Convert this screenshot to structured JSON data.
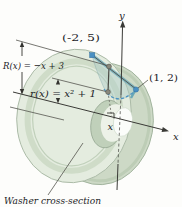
{
  "figure": {
    "type": "textbook-diagram",
    "points": {
      "upper": "(-2, 5)",
      "lower": "(1, 2)"
    },
    "labels": {
      "outer_radius": "R(x) = −x + 3",
      "inner_radius": "r(x) = x² + 1",
      "y_axis": "y",
      "x_axis": "x",
      "sample_x": "x",
      "caption": "Washer cross-section"
    },
    "colors": {
      "washer_face": "#e4ecdf",
      "washer_edge": "#a9b8a4",
      "washer_back": "#cdd9c6",
      "hole_rim": "#c0d0ba",
      "slab_fill": "rgba(174,203,199,0.45)",
      "slab_edge_teal": "#74aebb",
      "accent_blue": "#4a90c2",
      "ink": "#2a2a28"
    }
  }
}
